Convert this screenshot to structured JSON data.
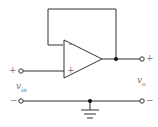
{
  "diagram": {
    "input": {
      "plus_label": "+",
      "minus_label": "−",
      "voltage_label": "v",
      "voltage_sub": "in"
    },
    "output": {
      "plus_label": "+",
      "minus_label": "−",
      "voltage_label": "v",
      "voltage_sub": "o"
    },
    "opamp": {
      "inverting_label": "−",
      "noninverting_label": "+"
    },
    "colors": {
      "wire": "#333333",
      "label": "#777777"
    }
  }
}
